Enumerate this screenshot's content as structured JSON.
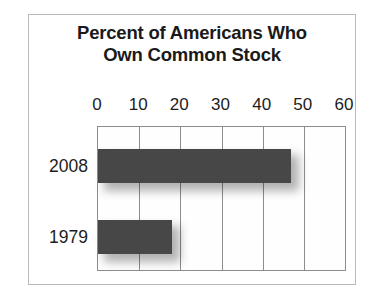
{
  "chart_data": {
    "type": "bar",
    "orientation": "horizontal",
    "title": "Percent of Americans Who Own Common Stock",
    "title_lines": [
      "Percent of Americans Who",
      "Own Common Stock"
    ],
    "categories": [
      "2008",
      "1979"
    ],
    "values": [
      47,
      18
    ],
    "xlabel": "",
    "ylabel": "",
    "xlim": [
      0,
      60
    ],
    "xticks": [
      0,
      10,
      20,
      30,
      40,
      50,
      60
    ],
    "xtick_labels": [
      "0",
      "10",
      "20",
      "30",
      "40",
      "50",
      "60"
    ],
    "grid": true,
    "grid_axis": "x",
    "legend": false,
    "axis_position": "top",
    "bar_color": "#474747",
    "plot_border_color": "#8d8d8d",
    "frame_border_color": "#b9b9b9",
    "background_color": "#ffffff",
    "text_color": "#1d1d1d",
    "series": [
      {
        "name": "Percent owning common stock",
        "points": [
          {
            "category": "2008",
            "value": 47
          },
          {
            "category": "1979",
            "value": 18
          }
        ]
      }
    ]
  }
}
